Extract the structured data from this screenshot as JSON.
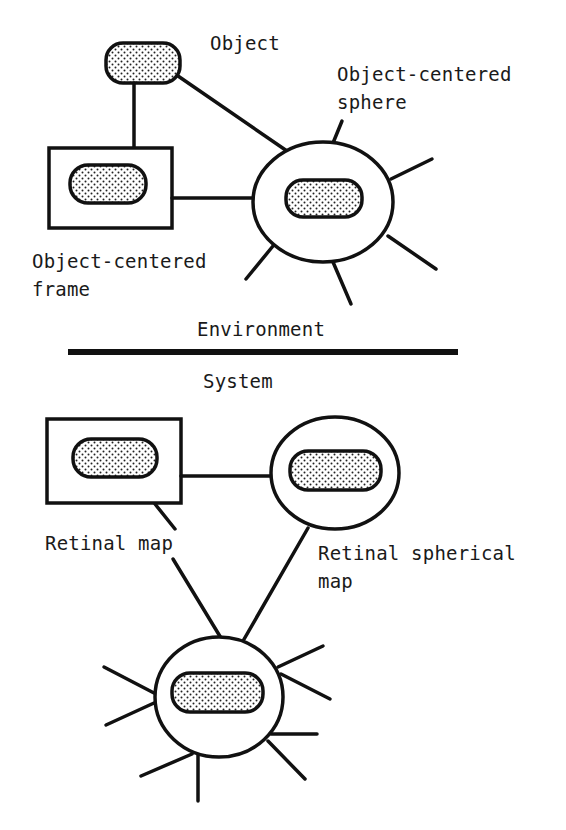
{
  "diagram": {
    "top_section": {
      "object_label": "Object",
      "object_centered_sphere_label_line1": "Object-centered",
      "object_centered_sphere_label_line2": "sphere",
      "object_centered_frame_label_line1": "Object-centered",
      "object_centered_frame_label_line2": "frame"
    },
    "divider": {
      "above_label": "Environment",
      "below_label": "System"
    },
    "bottom_section": {
      "retinal_map_label": "Retinal map",
      "retinal_spherical_map_label_line1": "Retinal spherical",
      "retinal_spherical_map_label_line2": "map"
    }
  },
  "colors": {
    "ink": "#111111",
    "background": "#ffffff",
    "fill_pattern": "stipple-dots"
  }
}
